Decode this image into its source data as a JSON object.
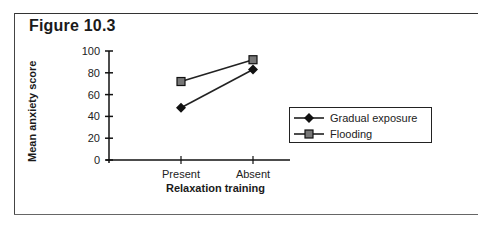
{
  "figure": {
    "title": "Figure 10.3"
  },
  "chart_data": {
    "type": "line",
    "title": "Figure 10.3",
    "xlabel": "Relaxation training",
    "ylabel": "Mean anxiety score",
    "categories": [
      "Present",
      "Absent"
    ],
    "series": [
      {
        "name": "Gradual exposure",
        "marker": "diamond",
        "values": [
          48,
          83
        ],
        "color": "#111111"
      },
      {
        "name": "Flooding",
        "marker": "square",
        "values": [
          72,
          92
        ],
        "color": "#444444"
      }
    ],
    "ylim": [
      0,
      100
    ],
    "yticks": [
      0,
      20,
      40,
      60,
      80,
      100
    ],
    "grid": false,
    "legend_position": "right"
  },
  "axes": {
    "x_label": "Relaxation training",
    "y_label": "Mean anxiety score",
    "x_ticks": [
      "Present",
      "Absent"
    ],
    "y_ticks": [
      "0",
      "20",
      "40",
      "60",
      "80",
      "100"
    ]
  },
  "legend": {
    "items": [
      {
        "label": "Gradual exposure",
        "marker": "diamond"
      },
      {
        "label": "Flooding",
        "marker": "square"
      }
    ]
  }
}
